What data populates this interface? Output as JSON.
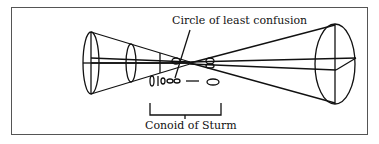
{
  "figure": {
    "labels": {
      "circle_of_least_confusion": "Circle of least confusion",
      "conoid_of_sturm": "Conoid of Sturm"
    }
  }
}
